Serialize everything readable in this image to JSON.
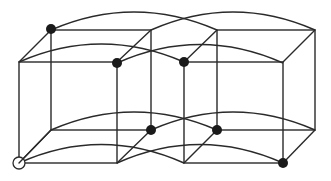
{
  "diagram": {
    "type": "wireframe-cubes",
    "colors": {
      "line": "#2a2a2a",
      "dot": "#1a1a1a",
      "background": "#ffffff"
    },
    "cubes": [
      {
        "name": "left-cube",
        "front": [
          19,
          62,
          117,
          163
        ],
        "back": [
          51,
          30,
          151,
          130
        ]
      },
      {
        "name": "right-cube",
        "front": [
          184,
          62,
          283,
          163
        ],
        "back": [
          217,
          30,
          315,
          130
        ]
      }
    ],
    "arcs": [
      {
        "from": [
          51,
          30
        ],
        "to": [
          217,
          30
        ],
        "ctrl": [
          134,
          -6
        ]
      },
      {
        "from": [
          151,
          30
        ],
        "to": [
          315,
          30
        ],
        "ctrl": [
          233,
          -6
        ]
      },
      {
        "from": [
          19,
          62
        ],
        "to": [
          184,
          62
        ],
        "ctrl": [
          101,
          26
        ]
      },
      {
        "from": [
          117,
          63
        ],
        "to": [
          283,
          63
        ],
        "ctrl": [
          200,
          26
        ]
      },
      {
        "from": [
          51,
          130
        ],
        "to": [
          217,
          130
        ],
        "ctrl": [
          134,
          94
        ]
      },
      {
        "from": [
          151,
          130
        ],
        "to": [
          315,
          130
        ],
        "ctrl": [
          233,
          94
        ]
      },
      {
        "from": [
          19,
          163
        ],
        "to": [
          184,
          163
        ],
        "ctrl": [
          101,
          126
        ]
      },
      {
        "from": [
          117,
          163
        ],
        "to": [
          283,
          163
        ],
        "ctrl": [
          200,
          126
        ]
      }
    ],
    "filled_vertices": [
      [
        51,
        29
      ],
      [
        117,
        63
      ],
      [
        184,
        62
      ],
      [
        151,
        130
      ],
      [
        217,
        130
      ],
      [
        283,
        163
      ]
    ],
    "open_vertices": [
      [
        19,
        163
      ]
    ]
  }
}
